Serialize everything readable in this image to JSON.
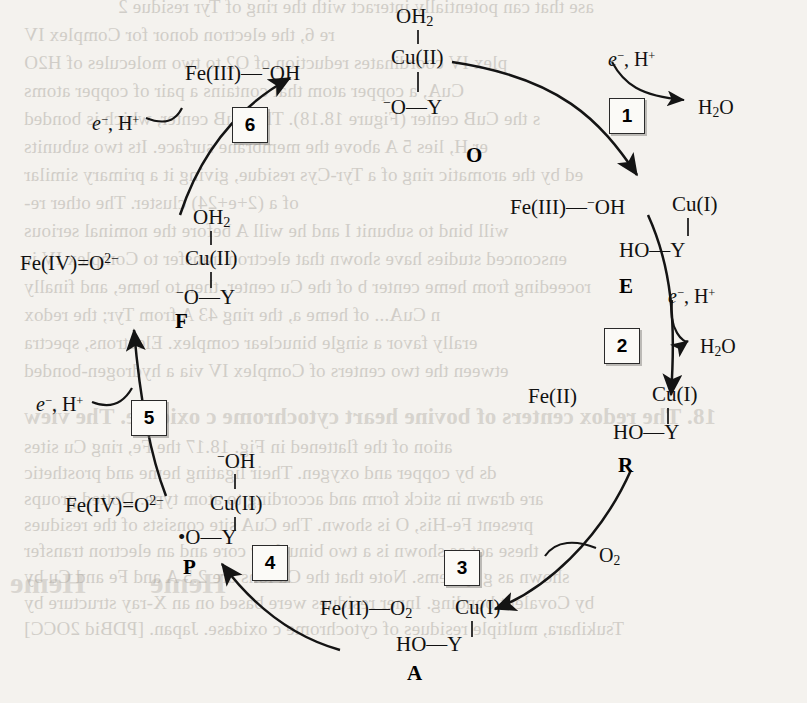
{
  "figure": {
    "type": "catalytic-cycle",
    "background_bleed": [
      "ase that can potentially interact with the ring of Tyr residue 2",
      "re 6, the electron donor for Complex IV",
      "plex IV coordinates reduction of O2 to two molecules of H2O",
      "CuA, a copper atom that contains a pair of copper atoms",
      "s the CuB center (Figure 18.18). The CuB center, which is bonded",
      "er H, lies 5 A above the membrane surface. Its two subunits",
      "ed by the aromatic ring of a Tyr-Cys residue, giving it a primary similar",
      "of a (2+e+24) cluster. The other re-",
      "will bind to subunit I and he will A before the nominal serious",
      "ensconced studies have shown that electron transfer to Complex IV is",
      "roceeding from heme center b of the Cu center, then to heme, and finally",
      "n CuA... of heme a, the ring 43 A from Tyr; the redox",
      "erally favor a single binuclear complex. Electrons, spectra",
      "etween the two centers of Complex IV via a hydrogen-bonded",
      "18.    The redox centers of bovine heart cytochrome c oxidase. The view",
      "ation of the flattened in Fig. 18.17 the Fe, ring Cu sites",
      "ds by copper and oxygen. Their ligating heme and prosthetic",
      "are drawn in stick form and according to atom type. Dotted groups",
      "present Fe-His, O is shown. The CuA site consists of the residues",
      "these act as shown is a two binuclear core and an electron transfer",
      "shown as g systems. Note that the Cu ions are 2.5 A and Fe and Cu by",
      "by Covalent bonding. Inner residues were based on an X-ray structure by",
      "Tsukihara, multiple residues of cytochrome c oxidase. Japan. [PDBid 2OCC]"
    ]
  },
  "structures": [
    {
      "id": "O",
      "label": "O",
      "label_pos": [
        466,
        143
      ],
      "fe_text": "Fe(III)—⁻OH",
      "fe_pos": [
        185,
        62
      ],
      "top_ligand": "OH₂",
      "top_pos": [
        396,
        6
      ],
      "cu_text": "Cu(II)",
      "cu_pos": [
        391,
        47
      ],
      "bottom_text": "⁻O—Y",
      "bottom_pos": [
        383,
        96
      ]
    },
    {
      "id": "E",
      "label": "E",
      "label_pos": [
        619,
        274
      ],
      "fe_text": "Fe(III)—⁻OH",
      "fe_pos": [
        510,
        196
      ],
      "cu_text": "Cu(I)",
      "cu_pos": [
        672,
        194
      ],
      "bottom_text": "HO—Y",
      "bottom_pos": [
        619,
        240
      ]
    },
    {
      "id": "R",
      "label": "R",
      "label_pos": [
        618,
        453
      ],
      "fe_text": "Fe(II)",
      "fe_pos": [
        528,
        386
      ],
      "cu_text": "Cu(I)",
      "cu_pos": [
        652,
        384
      ],
      "bottom_text": "HO—Y",
      "bottom_pos": [
        613,
        422
      ]
    },
    {
      "id": "A",
      "label": "A",
      "label_pos": [
        407,
        661
      ],
      "fe_text": "Fe(II)—O₂",
      "fe_pos": [
        320,
        598
      ],
      "cu_text": "Cu(I)",
      "cu_pos": [
        455,
        597
      ],
      "bottom_text": "HO—Y",
      "bottom_pos": [
        396,
        634
      ]
    },
    {
      "id": "P",
      "label": "P",
      "label_pos": [
        183,
        555
      ],
      "fe_text": "Fe(IV)=O²⁻",
      "fe_pos": [
        65,
        494
      ],
      "top_ligand": "⁻OH",
      "top_pos": [
        217,
        450
      ],
      "cu_text": "Cu(II)",
      "cu_pos": [
        210,
        493
      ],
      "bottom_text": "•O—Y",
      "bottom_pos": [
        178,
        527
      ]
    },
    {
      "id": "F",
      "label": "F",
      "label_pos": [
        175,
        309
      ],
      "fe_text": "Fe(IV)=O²⁻",
      "fe_pos": [
        20,
        252
      ],
      "top_ligand": "OH₂",
      "top_pos": [
        193,
        207
      ],
      "cu_text": "Cu(II)",
      "cu_pos": [
        185,
        248
      ],
      "bottom_text": "⁻O—Y",
      "bottom_pos": [
        176,
        286
      ]
    }
  ],
  "steps": [
    {
      "number": "1",
      "pos": [
        609,
        98
      ]
    },
    {
      "number": "2",
      "pos": [
        604,
        328
      ]
    },
    {
      "number": "3",
      "pos": [
        444,
        550
      ]
    },
    {
      "number": "4",
      "pos": [
        252,
        545
      ]
    },
    {
      "number": "5",
      "pos": [
        131,
        400
      ]
    },
    {
      "number": "6",
      "pos": [
        232,
        107
      ]
    }
  ],
  "cofactor_labels": [
    {
      "text": "e⁻, H⁺",
      "pos": [
        608,
        48
      ]
    },
    {
      "text": "e⁻, H⁺",
      "pos": [
        668,
        285
      ]
    },
    {
      "text": "e⁻, H⁺",
      "pos": [
        36,
        393
      ]
    },
    {
      "text": "e⁻, H⁺",
      "pos": [
        92,
        112
      ]
    }
  ],
  "small_molecules": [
    {
      "text": "H₂O",
      "pos": [
        698,
        96
      ]
    },
    {
      "text": "H₂O",
      "pos": [
        700,
        335
      ]
    },
    {
      "text": "O₂",
      "pos": [
        599,
        544
      ]
    }
  ]
}
